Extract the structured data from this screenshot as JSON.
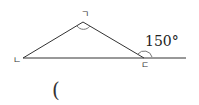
{
  "diagram": {
    "vertices": {
      "top": {
        "label": "ㄱ",
        "x": 83,
        "y": 22
      },
      "left": {
        "label": "ㄴ",
        "x": 23,
        "y": 58
      },
      "right": {
        "label": "ㄷ",
        "x": 144,
        "y": 58
      }
    },
    "baseline_extension_end_x": 186,
    "exterior_angle": {
      "value": "150°",
      "at_vertex": "ㄷ"
    },
    "answer_blank": "(",
    "line_color": "#333333"
  }
}
